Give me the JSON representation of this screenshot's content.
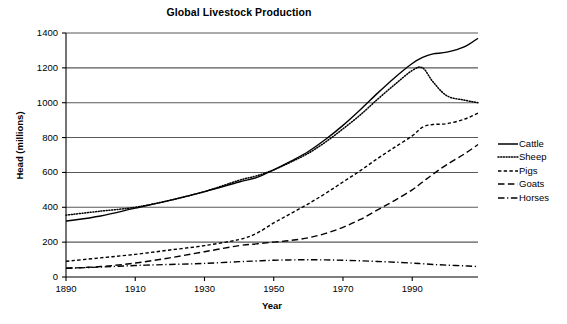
{
  "chart_data": {
    "type": "line",
    "title": "Global Livestock Production",
    "xlabel": "Year",
    "ylabel": "Head (millions)",
    "xlim": [
      1890,
      2009
    ],
    "ylim": [
      0,
      1400
    ],
    "xticks": [
      1890,
      1910,
      1930,
      1950,
      1970,
      1990
    ],
    "yticks": [
      0,
      200,
      400,
      600,
      800,
      1000,
      1200,
      1400
    ],
    "grid": "horizontal",
    "legend_position": "right",
    "x": [
      1890,
      1900,
      1910,
      1920,
      1930,
      1940,
      1945,
      1950,
      1955,
      1960,
      1965,
      1970,
      1975,
      1980,
      1985,
      1990,
      1993,
      1996,
      2000,
      2005,
      2009
    ],
    "series": [
      {
        "name": "Cattle",
        "style": "solid",
        "values": [
          320,
          350,
          395,
          440,
          490,
          545,
          570,
          615,
          665,
          720,
          790,
          870,
          960,
          1055,
          1145,
          1225,
          1260,
          1280,
          1290,
          1320,
          1370
        ]
      },
      {
        "name": "Sheep",
        "style": "dotted",
        "values": [
          355,
          378,
          400,
          440,
          490,
          555,
          580,
          615,
          660,
          710,
          775,
          850,
          930,
          1020,
          1105,
          1185,
          1200,
          1120,
          1040,
          1015,
          1000
        ]
      },
      {
        "name": "Pigs",
        "style": "dashed",
        "values": [
          90,
          110,
          130,
          155,
          180,
          215,
          250,
          310,
          365,
          420,
          480,
          545,
          610,
          680,
          745,
          810,
          860,
          875,
          880,
          905,
          940
        ]
      },
      {
        "name": "Goats",
        "style": "longdash",
        "values": [
          50,
          60,
          80,
          110,
          145,
          180,
          190,
          200,
          210,
          225,
          250,
          285,
          330,
          385,
          440,
          500,
          545,
          590,
          645,
          705,
          760
        ]
      },
      {
        "name": "Horses",
        "style": "dashdot",
        "values": [
          50,
          57,
          66,
          72,
          78,
          88,
          92,
          96,
          98,
          99,
          98,
          96,
          93,
          89,
          85,
          80,
          76,
          72,
          68,
          64,
          60
        ]
      }
    ]
  },
  "legend": {
    "items": [
      {
        "label": "Cattle",
        "style": "solid"
      },
      {
        "label": "Sheep",
        "style": "dotted"
      },
      {
        "label": "Pigs",
        "style": "dashed"
      },
      {
        "label": "Goats",
        "style": "longdash"
      },
      {
        "label": "Horses",
        "style": "dashdot"
      }
    ]
  }
}
